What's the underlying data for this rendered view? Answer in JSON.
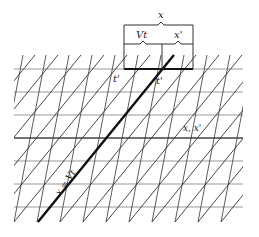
{
  "diagram": {
    "labels": {
      "x_total": "x",
      "vt": "Vt",
      "x_prime": "x'",
      "t_prime_left": "t'",
      "t_prime_right": "t'",
      "axes": "x, x'",
      "worldline": "x = Vt"
    },
    "colors": {
      "grid_horizontal": "#9a9a9a",
      "grid_lines": "#333333",
      "bold": "#111111",
      "background": "#ffffff"
    },
    "grid": {
      "left": 14,
      "right": 243,
      "top": 55,
      "bottom": 222,
      "horizontal_y": [
        69,
        92,
        115,
        138,
        161,
        184,
        207
      ],
      "spacing": 23,
      "steep_dx": 32,
      "diag_dx": 136
    }
  }
}
